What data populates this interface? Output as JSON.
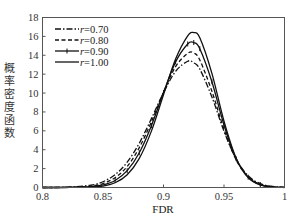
{
  "chart_data": {
    "type": "line",
    "title": "",
    "xlabel": "FDR",
    "ylabel": "概率密度函数",
    "xlim": [
      0.8,
      1.0
    ],
    "ylim": [
      0,
      18
    ],
    "xticks": [
      0.8,
      0.85,
      0.9,
      0.95,
      1
    ],
    "xtick_labels": [
      "0.8",
      "0.85",
      "0.9",
      "0.95",
      "1"
    ],
    "yticks": [
      0,
      2,
      4,
      6,
      8,
      10,
      12,
      14,
      16,
      18
    ],
    "ytick_labels": [
      "0",
      "2",
      "4",
      "6",
      "8",
      "10",
      "12",
      "14",
      "16",
      "18"
    ],
    "grid": false,
    "legend_position": "upper left",
    "x": [
      0.8,
      0.82,
      0.84,
      0.85,
      0.86,
      0.87,
      0.88,
      0.89,
      0.9,
      0.91,
      0.92,
      0.925,
      0.93,
      0.94,
      0.95,
      0.96,
      0.97,
      0.98,
      0.99,
      1.0
    ],
    "series": [
      {
        "name": "r=0.70",
        "style": "dash-dot",
        "color": "#111111",
        "values": [
          0.002,
          0.03,
          0.25,
          0.61,
          1.36,
          2.68,
          4.69,
          7.29,
          10.04,
          12.3,
          13.37,
          13.2,
          12.54,
          9.59,
          5.96,
          3.01,
          1.24,
          0.41,
          0.11,
          0.02
        ]
      },
      {
        "name": "r=0.80",
        "style": "dashed",
        "color": "#111111",
        "values": [
          0.0,
          0.013,
          0.15,
          0.42,
          1.04,
          2.23,
          4.22,
          6.96,
          10.08,
          12.8,
          14.2,
          14.25,
          13.5,
          10.2,
          6.16,
          2.94,
          1.12,
          0.34,
          0.08,
          0.01
        ]
      },
      {
        "name": "r=0.90",
        "style": "plus-marker",
        "color": "#111111",
        "values": [
          0.0,
          0.005,
          0.08,
          0.27,
          0.74,
          1.78,
          3.68,
          6.55,
          10.05,
          13.3,
          15.2,
          15.35,
          14.7,
          11.2,
          6.62,
          3.05,
          1.09,
          0.31,
          0.07,
          0.01
        ]
      },
      {
        "name": "r=1.00",
        "style": "solid",
        "color": "#111111",
        "values": [
          0.0,
          0.002,
          0.04,
          0.16,
          0.5,
          1.35,
          3.08,
          5.97,
          9.82,
          13.6,
          16.06,
          16.4,
          15.85,
          12.08,
          7.02,
          3.11,
          1.05,
          0.27,
          0.05,
          0.0
        ]
      }
    ]
  },
  "legend": {
    "items": [
      {
        "label": "r=0.70",
        "var": "r",
        "value": "=0.70"
      },
      {
        "label": "r=0.80",
        "var": "r",
        "value": "=0.80"
      },
      {
        "label": "r=0.90",
        "var": "r",
        "value": "=0.90"
      },
      {
        "label": "r=1.00",
        "var": "r",
        "value": "=1.00"
      }
    ]
  }
}
